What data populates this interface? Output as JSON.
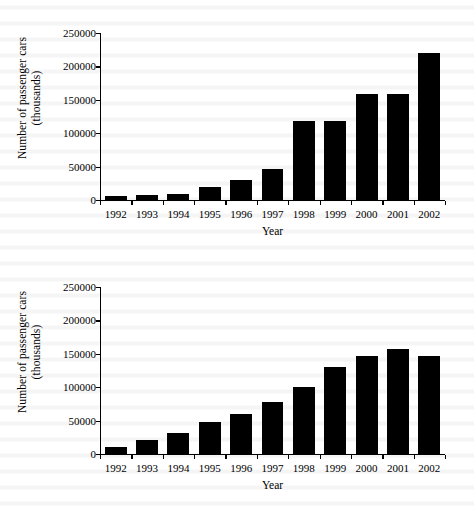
{
  "page": {
    "background_color": "#ffffff",
    "ink_color": "#000000"
  },
  "figures": [
    {
      "id": "figure-1",
      "name": "upper-bar-chart"
    },
    {
      "id": "figure-2",
      "name": "lower-bar-chart"
    }
  ],
  "axis": {
    "ylabel_line1": "Number of passenger cars",
    "ylabel_line2": "(thousands)",
    "xlabel": "Year",
    "yticks": [
      "0",
      "50000",
      "100000",
      "150000",
      "200000",
      "250000"
    ],
    "xticks": [
      "1992",
      "1993",
      "1994",
      "1995",
      "1996",
      "1997",
      "1998",
      "1999",
      "2000",
      "2001",
      "2002"
    ]
  },
  "chart_data": [
    {
      "type": "bar",
      "title": "",
      "xlabel": "Year",
      "ylabel": "Number of passenger cars (thousands)",
      "categories": [
        "1992",
        "1993",
        "1994",
        "1995",
        "1996",
        "1997",
        "1998",
        "1999",
        "2000",
        "2001",
        "2002"
      ],
      "values": [
        6000,
        7000,
        9000,
        19000,
        30000,
        47000,
        118000,
        118000,
        159000,
        159000,
        220000
      ],
      "ylim": [
        0,
        250000
      ],
      "ytick_step": 50000,
      "grid": false,
      "legend": null,
      "bar_color": "#000000"
    },
    {
      "type": "bar",
      "title": "",
      "xlabel": "Year",
      "ylabel": "Number of passenger cars (thousands)",
      "categories": [
        "1992",
        "1993",
        "1994",
        "1995",
        "1996",
        "1997",
        "1998",
        "1999",
        "2000",
        "2001",
        "2002"
      ],
      "values": [
        11000,
        21000,
        31000,
        48000,
        60000,
        78000,
        100000,
        130000,
        147000,
        157000,
        146000
      ],
      "ylim": [
        0,
        250000
      ],
      "ytick_step": 50000,
      "grid": false,
      "legend": null,
      "bar_color": "#000000"
    }
  ]
}
